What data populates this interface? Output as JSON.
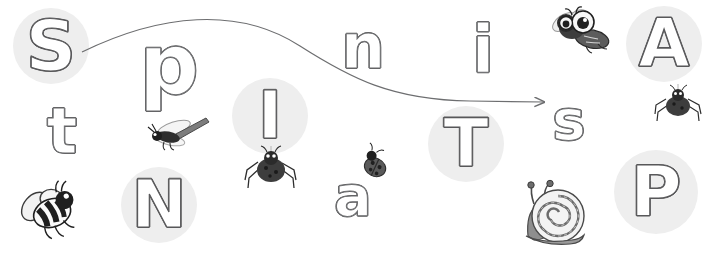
{
  "canvas": {
    "width": 711,
    "height": 253,
    "background": "#ffffff",
    "description": "Phonics worksheet scene with outline letters, grey highlight circles, a curved tracing arrow, and insect clip-art"
  },
  "palette": {
    "circle_fill": "#eeeeee",
    "letter_outline": "#58585a",
    "letter_fill": "#ffffff",
    "arrow_stroke": "#6d6e70",
    "critter_dark": "#3b3b3b",
    "critter_mid": "#8c8c8c",
    "critter_light": "#d8d8d8"
  },
  "arrow": {
    "name": "curved-tracing-arrow",
    "stroke_color": "#6d6e70",
    "stroke_width": 1.2,
    "start": [
      82,
      52
    ],
    "end": [
      545,
      102
    ],
    "path": "M82,52 C160,16 240,8 300,46 C352,79 392,100 470,101 L545,102",
    "head": "arrowhead at right end pointing right"
  },
  "letters": [
    {
      "char": "S",
      "name": "letter-s-capital",
      "x": 13,
      "y": 8,
      "size": 70,
      "circled": true,
      "circle_d": 76
    },
    {
      "char": "p",
      "name": "letter-p-lower",
      "x": 144,
      "y": 20,
      "size": 78,
      "circled": false
    },
    {
      "char": "n",
      "name": "letter-n-lower",
      "x": 340,
      "y": 18,
      "size": 62,
      "circled": false
    },
    {
      "char": "i",
      "name": "letter-i-lower",
      "x": 472,
      "y": 20,
      "size": 64,
      "circled": false
    },
    {
      "char": "A",
      "name": "letter-a-capital",
      "x": 626,
      "y": 6,
      "size": 68,
      "circle_d": 76,
      "circled": true
    },
    {
      "char": "t",
      "name": "letter-t-lower",
      "x": 46,
      "y": 104,
      "size": 62,
      "circled": false
    },
    {
      "char": "I",
      "name": "letter-i-capital",
      "x": 232,
      "y": 78,
      "size": 66,
      "circle_d": 76,
      "circled": true
    },
    {
      "char": "T",
      "name": "letter-t-capital",
      "x": 428,
      "y": 106,
      "size": 66,
      "circle_d": 76,
      "circled": true
    },
    {
      "char": "s",
      "name": "letter-s-lower",
      "x": 548,
      "y": 92,
      "size": 62,
      "circled": false
    },
    {
      "char": "N",
      "name": "letter-n-capital",
      "x": 121,
      "y": 167,
      "size": 66,
      "circle_d": 76,
      "circled": true
    },
    {
      "char": "a",
      "name": "letter-a-lower",
      "x": 332,
      "y": 168,
      "size": 62,
      "circled": false
    },
    {
      "char": "P",
      "name": "letter-p-capital",
      "x": 614,
      "y": 150,
      "size": 70,
      "circle_d": 84,
      "circled": true
    }
  ],
  "critters": [
    {
      "name": "bumblebee-icon",
      "label": "bumblebee",
      "x": 16,
      "y": 180,
      "w": 66,
      "h": 66
    },
    {
      "name": "dragonfly-icon",
      "label": "dragonfly",
      "x": 146,
      "y": 118,
      "w": 62,
      "h": 38
    },
    {
      "name": "spider-hanging-icon",
      "label": "hanging spider on thread",
      "x": 248,
      "y": 150,
      "w": 48,
      "h": 48
    },
    {
      "name": "ladybug-icon",
      "label": "ladybug",
      "x": 360,
      "y": 150,
      "w": 30,
      "h": 30
    },
    {
      "name": "fly-icon",
      "label": "cartoon fly with big eyes",
      "x": 546,
      "y": 8,
      "w": 68,
      "h": 46
    },
    {
      "name": "spider-small-icon",
      "label": "small spider on thread",
      "x": 658,
      "y": 92,
      "w": 46,
      "h": 42
    },
    {
      "name": "snail-icon",
      "label": "snail with spiral shell",
      "x": 516,
      "y": 182,
      "w": 76,
      "h": 64
    }
  ]
}
